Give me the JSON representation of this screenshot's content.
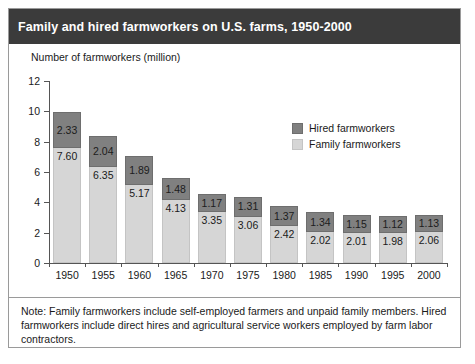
{
  "figure": {
    "title": "Family and hired farmworkers on U.S. farms, 1950-2000",
    "subtitle": "Number of farmworkers (million)",
    "note": "Note: Family farmworkers include self-employed farmers and unpaid family members. Hired farmworkers include direct hires and agricultural service workers employed by farm labor contractors."
  },
  "colors": {
    "title_bar": "#3b3b3b",
    "title_text": "#ffffff",
    "hired": "#808080",
    "family": "#d6d6d6",
    "axis": "#555555",
    "border": "#9a9a9a"
  },
  "legend": {
    "position": "inside-top-center",
    "entries": [
      {
        "label": "Hired farmworkers",
        "color": "#808080"
      },
      {
        "label": "Family farmworkers",
        "color": "#d6d6d6"
      }
    ]
  },
  "chart_data": {
    "type": "bar",
    "stacked": true,
    "title": "Family and hired farmworkers on U.S. farms, 1950-2000",
    "subtitle": "Number of farmworkers (million)",
    "xlabel": "",
    "ylabel": "Number of farmworkers (million)",
    "ylim": [
      0,
      12
    ],
    "yticks": [
      0,
      2,
      4,
      6,
      8,
      10,
      12
    ],
    "ytick_labels": [
      "0",
      "2",
      "4",
      "6",
      "8",
      "10",
      "12"
    ],
    "grid": false,
    "categories": [
      "1950",
      "1955",
      "1960",
      "1965",
      "1970",
      "1975",
      "1980",
      "1985",
      "1990",
      "1995",
      "2000"
    ],
    "series": [
      {
        "name": "Family farmworkers",
        "color": "#d6d6d6",
        "values": [
          7.6,
          6.35,
          5.17,
          4.13,
          3.35,
          3.06,
          2.42,
          2.02,
          2.01,
          1.98,
          2.06
        ],
        "labels": [
          "7.60",
          "6.35",
          "5.17",
          "4.13",
          "3.35",
          "3.06",
          "2.42",
          "2.02",
          "2.01",
          "1.98",
          "2.06"
        ]
      },
      {
        "name": "Hired farmworkers",
        "color": "#808080",
        "values": [
          2.33,
          2.04,
          1.89,
          1.48,
          1.17,
          1.31,
          1.37,
          1.34,
          1.15,
          1.12,
          1.13
        ],
        "labels": [
          "2.33",
          "2.04",
          "1.89",
          "1.48",
          "1.17",
          "1.31",
          "1.37",
          "1.34",
          "1.15",
          "1.12",
          "1.13"
        ]
      }
    ],
    "totals": [
      9.93,
      8.39,
      7.06,
      5.61,
      4.52,
      4.37,
      3.79,
      3.36,
      3.16,
      3.1,
      3.19
    ]
  }
}
